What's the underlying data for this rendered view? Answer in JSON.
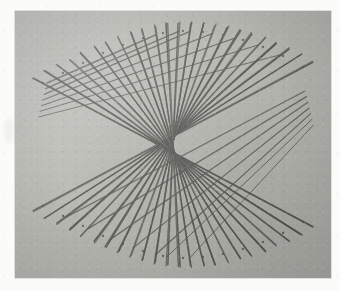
{
  "scan": {
    "page_background": "#fbfbfa",
    "photo_background": "#b7b7b2",
    "photo_rect": {
      "x": 15,
      "y": 11,
      "width": 316,
      "height": 267
    },
    "caption": "",
    "description": "Scanned photograph of a straight-line string-art construction: two opposing rails of pins joined in reverse order so the straight threads envelope a hyperbola with a narrow waist in the centre and flared bundles at the left and right."
  },
  "chart_data": {
    "type": "line",
    "title": "",
    "subtitle": "",
    "xlabel": "",
    "ylabel": "",
    "legend": [],
    "grid": false,
    "xlim": [
      0,
      316
    ],
    "ylim": [
      0,
      267
    ],
    "stroke_color": "#5c5c58",
    "stroke_width": 1.35,
    "point_count": 24,
    "annotations": [],
    "series": [
      {
        "name": "top-rail-pins",
        "comment": "pin positions along the upper rail of the figure, in card coordinates",
        "x": [
          28,
          48,
          68,
          88,
          108,
          128,
          148,
          168,
          188,
          208,
          228,
          248,
          268,
          288
        ],
        "y": [
          72,
          62,
          52,
          42,
          34,
          27,
          22,
          20,
          21,
          24,
          29,
          36,
          45,
          56
        ]
      },
      {
        "name": "bottom-rail-pins",
        "comment": "pin positions along the lower rail of the figure, in card coordinates",
        "x": [
          28,
          48,
          68,
          88,
          108,
          128,
          148,
          168,
          188,
          208,
          228,
          248,
          268,
          288
        ],
        "y": [
          195,
          205,
          215,
          225,
          233,
          240,
          245,
          247,
          246,
          243,
          238,
          231,
          222,
          211
        ]
      },
      {
        "name": "thread-pairs",
        "comment": "each straight thread connects top pin i to bottom pin (n-1-i); the family of chords envelopes the hyperbola",
        "values": [
          24,
          24
        ]
      }
    ]
  },
  "figure": {
    "name": "string-art-envelope",
    "thread_count": 48,
    "waist_centre": {
      "x": 160,
      "y": 134
    },
    "waist_half_width": 11,
    "flare_left": {
      "x": 26,
      "y": 88
    },
    "flare_right": {
      "x": 296,
      "y": 96
    },
    "thread_color": "#5a5a56",
    "thread_color_light": "#6e6e69",
    "thread_width_min": 0.9,
    "thread_width_max": 1.6
  }
}
